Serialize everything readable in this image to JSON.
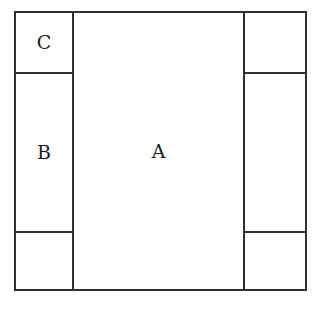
{
  "diagram": {
    "type": "partitioned-rectangle-schematic",
    "background_color": "#ffffff",
    "line_color": "#2f2f2f",
    "text_color": "#1c1c1c",
    "regions": {
      "center": {
        "label": "A"
      },
      "left_middle": {
        "label": "B"
      },
      "left_top": {
        "label": "C"
      },
      "left_bottom": {
        "label": ""
      },
      "right_top": {
        "label": ""
      },
      "right_middle": {
        "label": ""
      },
      "right_bottom": {
        "label": ""
      }
    }
  }
}
